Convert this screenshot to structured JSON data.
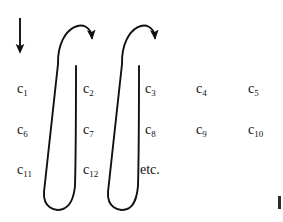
{
  "figure": {
    "background_color": "#ffffff",
    "ink_color": "#111111",
    "width": 283,
    "height": 222
  },
  "grid": {
    "columns": 5,
    "rows": 3,
    "column_x": [
      17,
      83,
      145,
      196,
      248
    ],
    "row_y": [
      82,
      123,
      163
    ],
    "cells": [
      {
        "base": "c",
        "sub": "1",
        "row": 0,
        "col": 0,
        "x": 17,
        "y": 82
      },
      {
        "base": "c",
        "sub": "2",
        "row": 0,
        "col": 1,
        "x": 83,
        "y": 82
      },
      {
        "base": "c",
        "sub": "3",
        "row": 0,
        "col": 2,
        "x": 145,
        "y": 82
      },
      {
        "base": "c",
        "sub": "4",
        "row": 0,
        "col": 3,
        "x": 196,
        "y": 82
      },
      {
        "base": "c",
        "sub": "5",
        "row": 0,
        "col": 4,
        "x": 248,
        "y": 82
      },
      {
        "base": "c",
        "sub": "6",
        "row": 1,
        "col": 0,
        "x": 17,
        "y": 123
      },
      {
        "base": "c",
        "sub": "7",
        "row": 1,
        "col": 1,
        "x": 83,
        "y": 123
      },
      {
        "base": "c",
        "sub": "8",
        "row": 1,
        "col": 2,
        "x": 145,
        "y": 123
      },
      {
        "base": "c",
        "sub": "9",
        "row": 1,
        "col": 3,
        "x": 196,
        "y": 123
      },
      {
        "base": "c",
        "sub": "10",
        "row": 1,
        "col": 4,
        "x": 248,
        "y": 123
      },
      {
        "base": "c",
        "sub": "11",
        "row": 2,
        "col": 0,
        "x": 17,
        "y": 163
      },
      {
        "base": "c",
        "sub": "12",
        "row": 2,
        "col": 1,
        "x": 83,
        "y": 163
      }
    ],
    "etc_label": "etc.",
    "etc_x": 140,
    "etc_y": 163
  },
  "annotations": {
    "entry_arrow": {
      "kind": "straight-down-arrow",
      "x": 20,
      "y_start": 18,
      "y_end": 57
    },
    "arches": [
      {
        "kind": "arch-arrow",
        "peak_x": 72,
        "peak_y": 19,
        "tip_x": 88,
        "tip_y": 55
      },
      {
        "kind": "arch-arrow",
        "peak_x": 136,
        "peak_y": 19,
        "tip_x": 150,
        "tip_y": 55
      }
    ],
    "hooks": [
      {
        "kind": "u-turn",
        "down_x_top": 62,
        "down_x_bottom": 44,
        "up_x": 76,
        "bottom_y": 207
      },
      {
        "kind": "u-turn",
        "down_x_top": 126,
        "down_x_bottom": 106,
        "up_x": 138,
        "bottom_y": 207
      }
    ],
    "edge_mark": {
      "x": 278,
      "y": 196,
      "width": 3,
      "height": 13
    }
  }
}
